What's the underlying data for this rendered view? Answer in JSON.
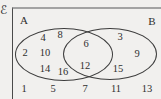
{
  "diagram": {
    "type": "venn-diagram",
    "universal_set_symbol": "ℰ",
    "set_a_label": "A",
    "set_b_label": "B",
    "numbers": [
      {
        "value": "4",
        "region": "a-only",
        "x": 43,
        "y": 38
      },
      {
        "value": "8",
        "region": "a-only",
        "x": 60,
        "y": 35
      },
      {
        "value": "2",
        "region": "a-only",
        "x": 25,
        "y": 53
      },
      {
        "value": "10",
        "region": "a-only",
        "x": 45,
        "y": 53
      },
      {
        "value": "14",
        "region": "a-only",
        "x": 45,
        "y": 69
      },
      {
        "value": "16",
        "region": "a-only",
        "x": 63,
        "y": 72
      },
      {
        "value": "6",
        "region": "intersection",
        "x": 86,
        "y": 44
      },
      {
        "value": "12",
        "region": "intersection",
        "x": 85,
        "y": 66
      },
      {
        "value": "3",
        "region": "b-only",
        "x": 120,
        "y": 37
      },
      {
        "value": "9",
        "region": "b-only",
        "x": 137,
        "y": 54
      },
      {
        "value": "15",
        "region": "b-only",
        "x": 118,
        "y": 69
      },
      {
        "value": "1",
        "region": "outside",
        "x": 24,
        "y": 89
      },
      {
        "value": "5",
        "region": "outside",
        "x": 53,
        "y": 89
      },
      {
        "value": "7",
        "region": "outside",
        "x": 85,
        "y": 89
      },
      {
        "value": "11",
        "region": "outside",
        "x": 116,
        "y": 89
      },
      {
        "value": "13",
        "region": "outside",
        "x": 147,
        "y": 89
      }
    ],
    "regions_summary": {
      "a_only": [
        4,
        8,
        2,
        10,
        14,
        16
      ],
      "intersection": [
        6,
        12
      ],
      "b_only": [
        3,
        9,
        15
      ],
      "outside": [
        1,
        5,
        7,
        11,
        13
      ]
    }
  },
  "colors": {
    "background": "#f1f0ee",
    "line": "#3d3d3d",
    "frame_top": "#a3a3a3",
    "frame_left": "#4a4a4a",
    "ink": "#2f2f2f"
  }
}
